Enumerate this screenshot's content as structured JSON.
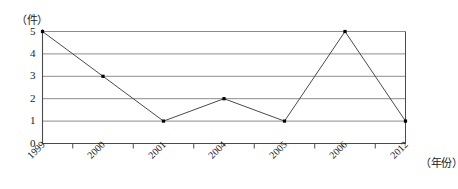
{
  "chart_data": {
    "type": "line",
    "title": "",
    "xlabel": "（年份）",
    "ylabel": "（件）",
    "categories": [
      "1999",
      "2000",
      "2001",
      "2004",
      "2005",
      "2006",
      "2012"
    ],
    "values": [
      5,
      3,
      1,
      2,
      1,
      5,
      1
    ],
    "series": [
      {
        "name": "",
        "values": [
          5,
          3,
          1,
          2,
          1,
          5,
          1
        ]
      }
    ],
    "ytick_labels": [
      "0",
      "1",
      "2",
      "3",
      "4",
      "5"
    ],
    "ylim": [
      0,
      5
    ],
    "grid": true,
    "legend": "none",
    "marker": "filled-square",
    "colors": {
      "line": "#4a4a4a",
      "marker": "#000000",
      "gridline": "#8c8c8c",
      "axis": "#4a4a4a",
      "background": "#ffffff",
      "text": "#1a1a1a"
    }
  }
}
